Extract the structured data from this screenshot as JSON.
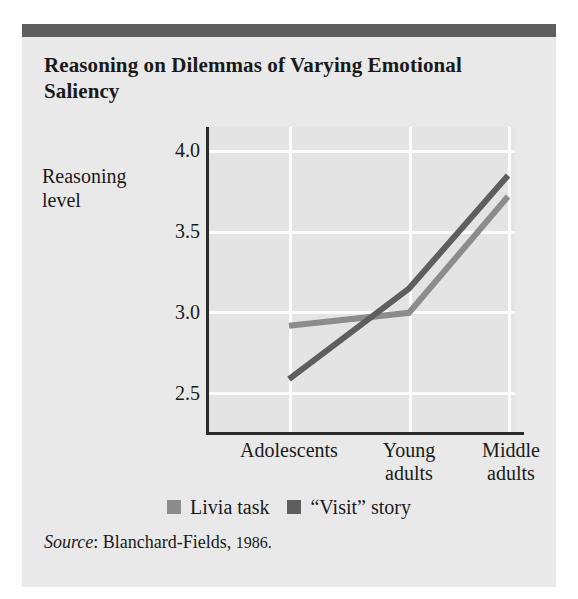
{
  "card": {
    "title": "Reasoning on Dilemmas of Varying Emotional Saliency",
    "topbar_color": "#5e5e5e",
    "background_color": "#e9e9e9"
  },
  "axis": {
    "y_axis_label": "Reasoning level",
    "y_ticks": [
      "4.0",
      "3.5",
      "3.0",
      "2.5"
    ],
    "x_categories": [
      "Adolescents",
      "Young adults",
      "Middle adults"
    ]
  },
  "legend": {
    "items": [
      {
        "label": "Livia task",
        "color": "#8c8c8c"
      },
      {
        "label": "“Visit” story",
        "color": "#5e5e5e"
      }
    ]
  },
  "source": {
    "prefix": "Source",
    "separator": ": ",
    "text": "Blanchard-Fields, ",
    "year": "1986."
  },
  "chart_data": {
    "type": "line",
    "title": "Reasoning on Dilemmas of Varying Emotional Saliency",
    "xlabel": "",
    "ylabel": "Reasoning level",
    "categories": [
      "Adolescents",
      "Young adults",
      "Middle adults"
    ],
    "ylim": [
      2.25,
      4.15
    ],
    "yticks": [
      2.5,
      3.0,
      3.5,
      4.0
    ],
    "grid": true,
    "legend_position": "bottom",
    "series": [
      {
        "name": "Livia task",
        "color": "#8c8c8c",
        "values": [
          2.92,
          3.0,
          3.72
        ]
      },
      {
        "name": "“Visit” story",
        "color": "#5e5e5e",
        "values": [
          2.59,
          3.15,
          3.85
        ]
      }
    ],
    "source": "Blanchard-Fields, 1986."
  }
}
